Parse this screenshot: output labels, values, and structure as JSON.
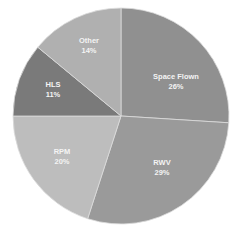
{
  "chart_data": {
    "type": "pie",
    "title": "",
    "start_angle_deg": 0,
    "direction": "clockwise",
    "categories": [
      "Space Flown",
      "RWV",
      "RPM",
      "HLS",
      "Other"
    ],
    "values": [
      26,
      29,
      20,
      11,
      14
    ],
    "labels": [
      "26%",
      "29%",
      "20%",
      "11%",
      "14%"
    ],
    "colors": [
      "#909090",
      "#9a9a9a",
      "#bdbdbd",
      "#7a7a7a",
      "#b0b0b0"
    ],
    "legend": "none",
    "data_labels": "inside (category name + percentage)"
  },
  "layout": {
    "cx": 121,
    "cy": 116,
    "r": 108,
    "label_positions": [
      {
        "x": 176,
        "y": 82
      },
      {
        "x": 162,
        "y": 168
      },
      {
        "x": 62,
        "y": 157
      },
      {
        "x": 53,
        "y": 90
      },
      {
        "x": 89,
        "y": 46
      }
    ]
  }
}
